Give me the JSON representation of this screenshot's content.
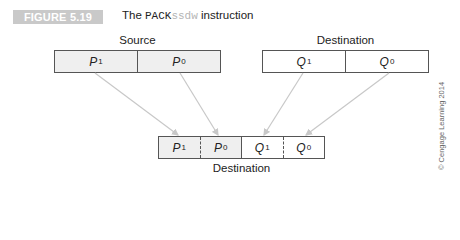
{
  "figure": {
    "badge": "FIGURE 5.19",
    "caption_prefix": "The ",
    "caption_mnemonic": "PACK",
    "caption_suffix_light": "ssdw",
    "caption_rest": " instruction"
  },
  "source": {
    "label": "Source",
    "cells": [
      {
        "name": "P",
        "sub": "1"
      },
      {
        "name": "P",
        "sub": "0"
      }
    ]
  },
  "destination_in": {
    "label": "Destination",
    "cells": [
      {
        "name": "Q",
        "sub": "1"
      },
      {
        "name": "Q",
        "sub": "0"
      }
    ]
  },
  "destination_out": {
    "label": "Destination",
    "cells": [
      {
        "name": "P",
        "sub": "1"
      },
      {
        "name": "P",
        "sub": "0"
      },
      {
        "name": "Q",
        "sub": "1"
      },
      {
        "name": "Q",
        "sub": "0"
      }
    ]
  },
  "credit": "© Cengage Learning 2014",
  "colors": {
    "badge_bg": "#c9c9c9",
    "shaded_cell": "#efefef",
    "arrow": "#c8c8c8",
    "border": "#555555"
  }
}
